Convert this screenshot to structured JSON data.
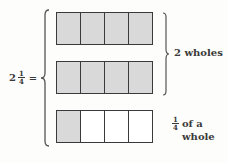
{
  "diagram": {
    "equation": {
      "whole": "2",
      "numerator": "1",
      "denominator": "4",
      "equals": "="
    },
    "bars": [
      {
        "cells": [
          true,
          true,
          true,
          true
        ]
      },
      {
        "cells": [
          true,
          true,
          true,
          true
        ]
      },
      {
        "cells": [
          true,
          false,
          false,
          false
        ]
      }
    ],
    "labels": {
      "wholes": "2 wholes",
      "fraction_numerator": "1",
      "fraction_denominator": "4",
      "fraction_text_line1": "of a",
      "fraction_text_line2": "whole"
    },
    "colors": {
      "shaded": "#d9d9d9",
      "unshaded": "#ffffff",
      "stroke": "#3a3a3a"
    }
  }
}
